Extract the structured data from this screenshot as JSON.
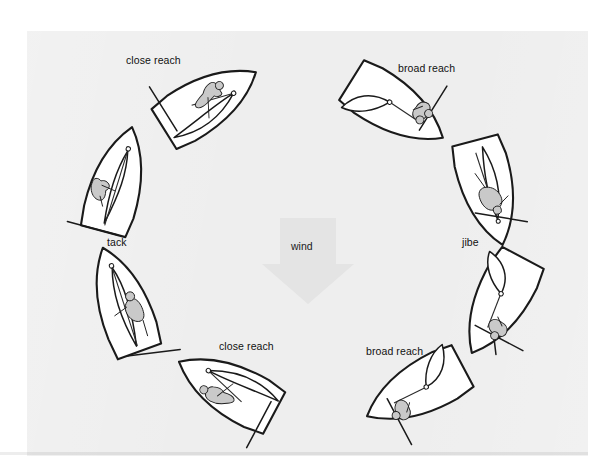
{
  "figure": {
    "background_color": "#eeeeee",
    "page_color": "#ffffff",
    "ink_color": "#1a1a1a",
    "sailor_fill": "#c9c9c9"
  },
  "wind": {
    "label": "wind",
    "direction": "down",
    "arrow_color": "#e4e4e4",
    "label_x": 291,
    "label_y": 241
  },
  "labels": [
    {
      "id": "close-reach-upper-left",
      "text": "close reach",
      "x": 126,
      "y": 55
    },
    {
      "id": "broad-reach-upper-right",
      "text": "broad reach",
      "x": 398,
      "y": 63
    },
    {
      "id": "tack",
      "text": "tack",
      "x": 107,
      "y": 237
    },
    {
      "id": "jibe",
      "text": "jibe",
      "x": 462,
      "y": 237
    },
    {
      "id": "close-reach-lower",
      "text": "close reach",
      "x": 219,
      "y": 341
    },
    {
      "id": "broad-reach-lower-right",
      "text": "broad reach",
      "x": 366,
      "y": 346
    }
  ],
  "boats": [
    {
      "id": "boat-tack",
      "point_of_sail": "close hauled / head to wind",
      "heading_deg": 15,
      "cx": 116,
      "cy": 187,
      "label_ref": "tack"
    },
    {
      "id": "boat-close-reach-upper",
      "point_of_sail": "close reach",
      "heading_deg": 58,
      "cx": 205,
      "cy": 104,
      "label_ref": "close-reach-upper-left"
    },
    {
      "id": "boat-broad-reach-upper",
      "point_of_sail": "broad reach",
      "heading_deg": 122,
      "cx": 392,
      "cy": 106,
      "label_ref": "broad-reach-upper-right"
    },
    {
      "id": "boat-jibe",
      "point_of_sail": "running / dead downwind",
      "heading_deg": 165,
      "cx": 487,
      "cy": 187,
      "label_ref": "jibe"
    },
    {
      "id": "boat-broad-reach-lower",
      "point_of_sail": "broad reach",
      "heading_deg": 208,
      "cx": 500,
      "cy": 300,
      "label_ref": null
    },
    {
      "id": "boat-broad-reach-lower-two",
      "point_of_sail": "broad reach",
      "heading_deg": 242,
      "cx": 420,
      "cy": 388,
      "label_ref": "broad-reach-lower-right"
    },
    {
      "id": "boat-close-reach-lower",
      "point_of_sail": "close reach",
      "heading_deg": 298,
      "cx": 232,
      "cy": 390,
      "label_ref": "close-reach-lower"
    },
    {
      "id": "boat-close-hauled-lower",
      "point_of_sail": "close hauled",
      "heading_deg": 340,
      "cx": 124,
      "cy": 306,
      "label_ref": null
    }
  ]
}
